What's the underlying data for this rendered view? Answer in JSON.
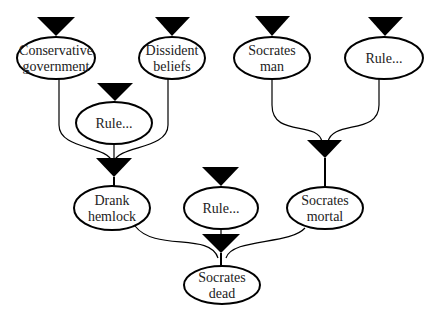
{
  "diagram": {
    "type": "inference-tree",
    "nodes": [
      {
        "id": "conservative",
        "lines": [
          "Conservative",
          "government"
        ],
        "cx": 56,
        "cy": 58,
        "rx": 39,
        "ry": 21
      },
      {
        "id": "dissident",
        "lines": [
          "Dissident",
          "beliefs"
        ],
        "cx": 172,
        "cy": 58,
        "rx": 33,
        "ry": 21
      },
      {
        "id": "rule1",
        "lines": [
          "Rule..."
        ],
        "cx": 114,
        "cy": 123,
        "rx": 38,
        "ry": 21
      },
      {
        "id": "socrates_man",
        "lines": [
          "Socrates",
          "man"
        ],
        "cx": 272,
        "cy": 58,
        "rx": 38,
        "ry": 21
      },
      {
        "id": "rule2",
        "lines": [
          "Rule..."
        ],
        "cx": 384,
        "cy": 58,
        "rx": 39,
        "ry": 21
      },
      {
        "id": "drank",
        "lines": [
          "Drank",
          "hemlock"
        ],
        "cx": 112,
        "cy": 208,
        "rx": 38,
        "ry": 22
      },
      {
        "id": "rule3",
        "lines": [
          "Rule..."
        ],
        "cx": 221,
        "cy": 208,
        "rx": 37,
        "ry": 21
      },
      {
        "id": "socrates_mortal",
        "lines": [
          "Socrates",
          "mortal"
        ],
        "cx": 325,
        "cy": 208,
        "rx": 38,
        "ry": 21
      },
      {
        "id": "socrates_dead",
        "lines": [
          "Socrates",
          "dead"
        ],
        "cx": 222,
        "cy": 285,
        "rx": 38,
        "ry": 19
      }
    ],
    "edges": [
      {
        "from": "conservative",
        "to": "drank"
      },
      {
        "from": "dissident",
        "to": "drank"
      },
      {
        "from": "rule1",
        "to": "drank"
      },
      {
        "from": "socrates_man",
        "to": "socrates_mortal"
      },
      {
        "from": "rule2",
        "to": "socrates_mortal"
      },
      {
        "from": "drank",
        "to": "socrates_dead"
      },
      {
        "from": "rule3",
        "to": "socrates_dead"
      },
      {
        "from": "socrates_mortal",
        "to": "socrates_dead"
      }
    ]
  },
  "labels": {
    "conservative": [
      "Conservative",
      "government"
    ],
    "dissident": [
      "Dissident",
      "beliefs"
    ],
    "rule1": [
      "Rule..."
    ],
    "socrates_man": [
      "Socrates",
      "man"
    ],
    "rule2": [
      "Rule..."
    ],
    "drank": [
      "Drank",
      "hemlock"
    ],
    "rule3": [
      "Rule..."
    ],
    "socrates_mortal": [
      "Socrates",
      "mortal"
    ],
    "socrates_dead": [
      "Socrates",
      "dead"
    ]
  }
}
